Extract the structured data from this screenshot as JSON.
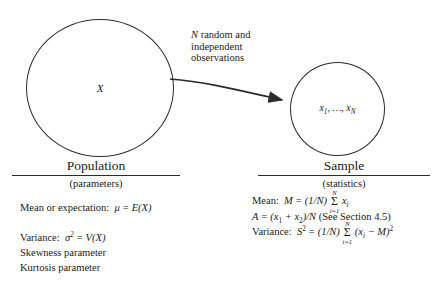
{
  "diagram": {
    "population_circle": {
      "label": "X",
      "name": "population-circle"
    },
    "sample_circle": {
      "label_prefix": "x",
      "label_sub1": "1",
      "label_mid": ", …, ",
      "label_last": "x",
      "label_subN": "N",
      "label_plain": "x1, ..., xN"
    },
    "arrow_annotation": {
      "line1_italic": "N",
      "line1_rest": " random and",
      "line2": "independent",
      "line3": "observations"
    }
  },
  "population": {
    "heading": "Population",
    "subheading": "(parameters)",
    "formulas": {
      "mean_label": "Mean or expectation:",
      "mean_mu": "μ",
      "mean_eq": "=",
      "mean_rhs_fn": "E",
      "mean_rhs_arg": "(X)",
      "variance_label": "Variance:",
      "variance_sigma": "σ",
      "variance_sigma_sup": "2",
      "variance_eq": "=",
      "variance_rhs_fn": "V",
      "variance_rhs_arg": "(X)",
      "skewness": "Skewness parameter",
      "kurtosis": "Kurtosis parameter"
    }
  },
  "sample": {
    "heading": "Sample",
    "subheading": "(statistics)",
    "formulas": {
      "mean_label": "Mean:",
      "mean_symbol": "M",
      "mean_eq": "=",
      "mean_factor": "(1/N)",
      "sum_upper": "N",
      "sum_lower": "i=1",
      "sum_glyph": "Σ",
      "mean_term": "x",
      "mean_term_sub": "i",
      "alt_symbol": "A",
      "alt_eq": "=",
      "alt_open": "(x",
      "alt_sub1": "1",
      "alt_plus": "+ x",
      "alt_sub2": "2",
      "alt_close": ")/N",
      "alt_note": "(See Section 4.5)",
      "variance_label": "Variance:",
      "variance_symbol": "S",
      "variance_sup": "2",
      "variance_eq": "=",
      "variance_factor": "(1/N)",
      "variance_term_open": "(x",
      "variance_term_sub": "i",
      "variance_minus": "− M)",
      "variance_term_sup": "2"
    }
  },
  "colors": {
    "ink": "#1a1a1a",
    "stroke": "#2b2b2b",
    "background": "#ffffff"
  }
}
